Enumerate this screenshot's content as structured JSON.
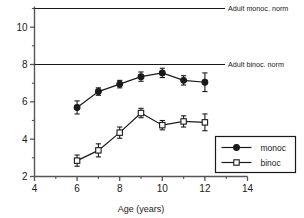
{
  "chart_data": {
    "type": "line",
    "title": "",
    "xlabel": "Age  (years)",
    "ylabel": "",
    "xlim": [
      4,
      14
    ],
    "ylim": [
      2,
      11
    ],
    "x_major_ticks": [
      4,
      6,
      8,
      10,
      12,
      14
    ],
    "x_minor_ticks": [
      5,
      7,
      9,
      11,
      13
    ],
    "y_major_ticks": [
      2,
      4,
      6,
      8,
      10
    ],
    "y_minor_ticks": [
      3,
      5,
      7,
      9,
      11
    ],
    "x_tick_labels": [
      "4",
      "6",
      "8",
      "10",
      "12",
      "14"
    ],
    "y_tick_labels": [
      "2",
      "4",
      "6",
      "8",
      "10"
    ],
    "grid": false,
    "legend_position": "lower-right",
    "x": [
      6,
      7,
      8,
      9,
      10,
      11,
      12
    ],
    "series": [
      {
        "name": "monoc",
        "marker": "filled-circle",
        "values": [
          5.7,
          6.55,
          6.95,
          7.35,
          7.55,
          7.15,
          7.05
        ],
        "errors": [
          0.35,
          0.2,
          0.2,
          0.25,
          0.25,
          0.25,
          0.5
        ]
      },
      {
        "name": "binoc",
        "marker": "open-square",
        "values": [
          2.85,
          3.4,
          4.35,
          5.4,
          4.75,
          4.95,
          4.9
        ],
        "errors": [
          0.3,
          0.35,
          0.3,
          0.25,
          0.25,
          0.3,
          0.45
        ]
      }
    ],
    "reference_lines": [
      {
        "label": "Adult monoc. norm",
        "value": 11
      },
      {
        "label": "Adult binoc. norm",
        "value": 8
      }
    ],
    "colors": {
      "line": "#1a1a1a",
      "marker_fill": "#1a1a1a",
      "open_marker_fill": "#ffffff",
      "axis": "#555555",
      "text": "#1a1a1a"
    }
  },
  "legend": {
    "entries": [
      {
        "label": "monoc"
      },
      {
        "label": "binoc"
      }
    ]
  }
}
